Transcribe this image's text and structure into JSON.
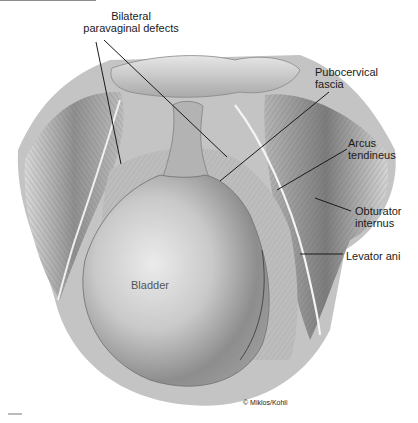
{
  "figure": {
    "labels": [
      {
        "id": "bilateral",
        "line1": "Bilateral",
        "line2": "paravaginal defects",
        "x": 68,
        "y": 10,
        "align": "center",
        "width": 126
      },
      {
        "id": "pubocervical",
        "line1": "Pubocervical",
        "line2": "fascia",
        "x": 315,
        "y": 66
      },
      {
        "id": "arcus",
        "line1": "Arcus",
        "line2": "tendineus",
        "x": 348,
        "y": 137
      },
      {
        "id": "obturator",
        "line1": "Obturator",
        "line2": "internus",
        "x": 355,
        "y": 205
      },
      {
        "id": "levator",
        "line1": "Levator ani",
        "line2": "",
        "x": 346,
        "y": 250
      }
    ],
    "inside_label": {
      "id": "bladder",
      "text": "Bladder",
      "x": 131,
      "y": 279
    },
    "credit": {
      "text": "© Miklos/Kohli",
      "x": 243,
      "y": 399
    },
    "leader_lines": [
      {
        "for": "bilateral-left",
        "x1": 96,
        "y1": 42,
        "x2": 121,
        "y2": 164
      },
      {
        "for": "bilateral-right",
        "x1": 104,
        "y1": 40,
        "x2": 227,
        "y2": 157
      },
      {
        "for": "pubocervical",
        "x1": 329,
        "y1": 92,
        "x2": 220,
        "y2": 181
      },
      {
        "for": "arcus",
        "x1": 347,
        "y1": 149,
        "x2": 277,
        "y2": 190
      },
      {
        "for": "obturator",
        "x1": 351,
        "y1": 211,
        "x2": 315,
        "y2": 198
      },
      {
        "for": "levator",
        "x1": 343,
        "y1": 254,
        "x2": 300,
        "y2": 254
      }
    ],
    "colors": {
      "background": "#ffffff",
      "ink": "#1a1a1a",
      "tissue_light": "#d6d6d6",
      "tissue_mid": "#a8a8a8",
      "tissue_dark": "#6e6e6e",
      "bladder_light": "#e4e4e4",
      "bladder_dark": "#7a7a7a"
    }
  }
}
